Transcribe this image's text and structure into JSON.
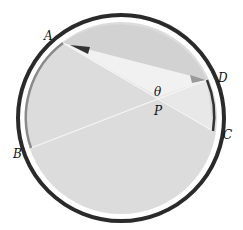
{
  "diagram": {
    "points": {
      "A": {
        "label": "A"
      },
      "B": {
        "label": "B"
      },
      "C": {
        "label": "C"
      },
      "D": {
        "label": "D"
      },
      "P": {
        "label": "P"
      }
    },
    "angle_label": "θ",
    "colors": {
      "outer_ring": "#2a2a2a",
      "disk_fill": "#dcdcdc",
      "wedge_light": "#efefef",
      "upper_region": "#d4d4d4",
      "arc_BA": "#8a8a8a",
      "arc_DC": "#333333",
      "arrow_dark": "#333333",
      "arrow_light": "#9a9a9a"
    }
  }
}
